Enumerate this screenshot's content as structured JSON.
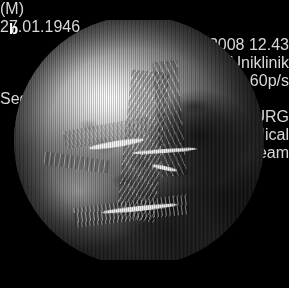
{
  "panel": {
    "label": "b"
  },
  "overlay": {
    "patient": {
      "sex": "(M)",
      "birth_date": "27.01.1946"
    },
    "study": {
      "datetime": "16.07.2008 12.43",
      "institution": "Freiburg-Uniklinik"
    },
    "framerate": "60p/s",
    "sequence": "SeqNR: 0",
    "footer": {
      "site": "UKL FREIBURG",
      "system": "Image Stream Medical",
      "product": "Arthrex nStream"
    }
  },
  "colors": {
    "background": "#000000",
    "overlay_text": "#c9c9c9",
    "panel_label": "#ffffff"
  },
  "image": {
    "modality": "endoscopic-video-frame",
    "rendering": "grayscale-circular-scope-view"
  }
}
